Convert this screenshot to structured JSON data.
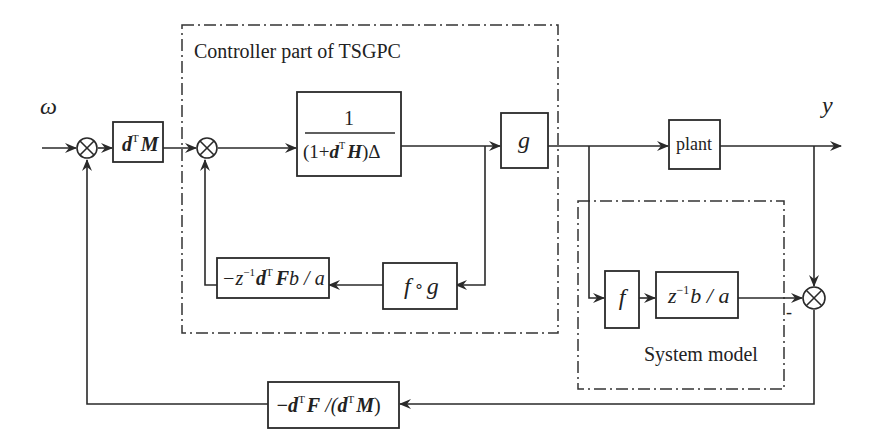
{
  "diagram": {
    "signals": {
      "input": "ω",
      "output": "y"
    },
    "groups": {
      "controller": {
        "label": "Controller part of TSGPC"
      },
      "model": {
        "label": "System model"
      }
    },
    "blocks": {
      "dTM": {
        "pre": "d",
        "sup": "T",
        "post": "M"
      },
      "integrator": {
        "numerator": "1",
        "den_open": "(1+",
        "den_d": "d",
        "den_sup": "T",
        "den_H": "H",
        "den_close": ")Δ"
      },
      "g": {
        "label": "g"
      },
      "plant": {
        "label": "plant"
      },
      "fog": {
        "f": "f",
        "op": "∘",
        "g": "g"
      },
      "feedback_inner": {
        "minus_z": "−z",
        "z_sup": "−1",
        "d": "d",
        "d_sup": "T",
        "F": "F",
        "rest": "b / a"
      },
      "f": {
        "label": "f"
      },
      "model_tf": {
        "z": "z",
        "z_sup": "−1",
        "rest": "b / a"
      },
      "feedback_outer": {
        "minus_d": "−d",
        "d_sup": "T",
        "F": "F",
        "mid": " /(",
        "d2": "d",
        "d2_sup": "T",
        "M": "M",
        "close": ")"
      }
    },
    "sign_labels": {
      "model_minus": "-"
    }
  }
}
